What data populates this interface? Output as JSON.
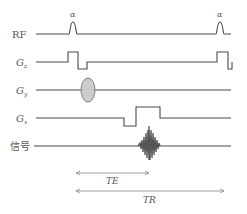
{
  "diagram": {
    "type": "mri-pulse-sequence",
    "rows": [
      {
        "id": "rf",
        "label": "RF",
        "label_main": "RF",
        "label_sub": ""
      },
      {
        "id": "gz",
        "label": "G_z",
        "label_main": "G",
        "label_sub": "z"
      },
      {
        "id": "gy",
        "label": "G_y",
        "label_main": "G",
        "label_sub": "y"
      },
      {
        "id": "gx",
        "label": "G_x",
        "label_main": "G",
        "label_sub": "x"
      },
      {
        "id": "signal",
        "label": "信号",
        "label_main": "信号",
        "label_sub": ""
      }
    ],
    "pulses": [
      {
        "row": "rf",
        "label": "α",
        "position": "first"
      },
      {
        "row": "rf",
        "label": "α",
        "position": "second"
      }
    ],
    "intervals": [
      {
        "label": "TE",
        "from": "excitation",
        "to": "echo"
      },
      {
        "label": "TR",
        "from": "excitation",
        "to": "next excitation"
      }
    ],
    "colors": {
      "line": "#4a4a4a",
      "phase_encode_fill": "#cccccc",
      "echo": "#555555",
      "arrow": "#888888",
      "text": "#555555"
    }
  }
}
